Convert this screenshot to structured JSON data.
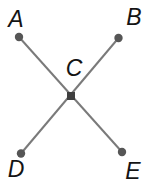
{
  "diagram": {
    "background_color": "#ffffff",
    "line_color": "#7a7a7a",
    "line_width": 2,
    "endpoint_dot_color": "#565656",
    "endpoint_dot_radius": 4.2,
    "center_dot_color": "#3f3f3f",
    "center_dot_size": 8,
    "label_color": "#141414",
    "points": [
      {
        "id": "A",
        "label": "A",
        "x": 19,
        "y": 37,
        "label_x": 16,
        "label_y": 27,
        "dot": "circle"
      },
      {
        "id": "B",
        "label": "B",
        "x": 118.5,
        "y": 38,
        "label_x": 134,
        "label_y": 25,
        "dot": "circle"
      },
      {
        "id": "C",
        "label": "C",
        "x": 71,
        "y": 96,
        "label_x": 74,
        "label_y": 76,
        "dot": "square"
      },
      {
        "id": "D",
        "label": "D",
        "x": 21,
        "y": 153.5,
        "label_x": 16,
        "label_y": 177,
        "dot": "circle"
      },
      {
        "id": "E",
        "label": "E",
        "x": 122,
        "y": 152,
        "label_x": 133,
        "label_y": 179,
        "dot": "circle"
      }
    ],
    "segments": [
      {
        "from": "A",
        "to": "E"
      },
      {
        "from": "B",
        "to": "D"
      }
    ]
  }
}
